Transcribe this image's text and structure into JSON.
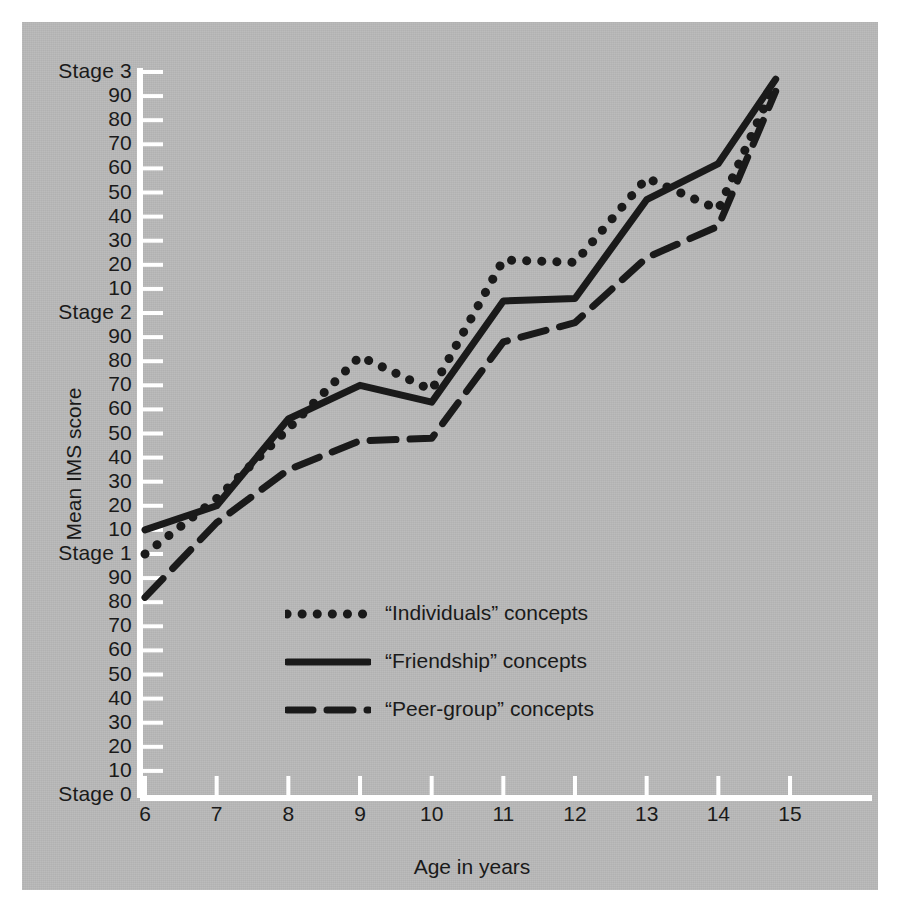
{
  "figure": {
    "background_color": "#b9b9b9",
    "ink_color": "#1a1a1a",
    "axis_color": "#ffffff"
  },
  "chart_data": {
    "type": "line",
    "title": "",
    "xlabel": "Age in years",
    "ylabel": "Mean IMS score",
    "x": [
      6,
      7,
      8,
      9,
      10,
      11,
      12,
      13,
      14,
      14.8
    ],
    "xlim": [
      6,
      15
    ],
    "xticks": [
      6,
      7,
      8,
      9,
      10,
      11,
      12,
      13,
      14,
      15
    ],
    "xticklabels": [
      "6",
      "7",
      "8",
      "9",
      "10",
      "11",
      "12",
      "13",
      "14",
      "15"
    ],
    "grid": false,
    "legend_position": "inside-lower-center",
    "yaxis_note": "Cyclical IMS scale: Stage 0, then 10-90, Stage 1, 10-90, Stage 2, 10-90, Stage 3",
    "ylim": [
      0,
      300
    ],
    "yticks": [
      0,
      10,
      20,
      30,
      40,
      50,
      60,
      70,
      80,
      90,
      100,
      110,
      120,
      130,
      140,
      150,
      160,
      170,
      180,
      190,
      200,
      210,
      220,
      230,
      240,
      250,
      260,
      270,
      280,
      290,
      300
    ],
    "yticklabels": [
      "Stage 0",
      "10",
      "20",
      "30",
      "40",
      "50",
      "60",
      "70",
      "80",
      "90",
      "Stage 1",
      "10",
      "20",
      "30",
      "40",
      "50",
      "60",
      "70",
      "80",
      "90",
      "Stage 2",
      "10",
      "20",
      "30",
      "40",
      "50",
      "60",
      "70",
      "80",
      "90",
      "Stage 3"
    ],
    "series": [
      {
        "name": "“Individuals” concepts",
        "style": "dotted",
        "values": [
          100,
          123,
          152,
          182,
          168,
          222,
          221,
          256,
          243,
          296
        ]
      },
      {
        "name": "“Friendship” concepts",
        "style": "solid",
        "values": [
          110,
          120,
          156,
          170,
          163,
          205,
          206,
          247,
          262,
          297
        ]
      },
      {
        "name": "“Peer-group” concepts",
        "style": "dashed",
        "values": [
          82,
          113,
          135,
          147,
          148,
          188,
          196,
          223,
          236,
          292
        ]
      }
    ]
  },
  "legend": {
    "entries": [
      {
        "label": "“Individuals” concepts",
        "style": "dotted"
      },
      {
        "label": "“Friendship” concepts",
        "style": "solid"
      },
      {
        "label": "“Peer-group” concepts",
        "style": "dashed"
      }
    ]
  }
}
